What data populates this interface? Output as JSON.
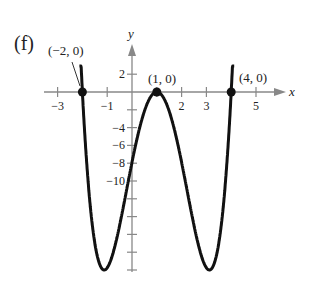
{
  "panel_label": "(f)",
  "chart_data": {
    "type": "line",
    "title": "",
    "xlabel": "x",
    "ylabel": "y",
    "xlim": [
      -3.5,
      6.5
    ],
    "ylim": [
      -20,
      3
    ],
    "grid": false,
    "x_ticks": [
      -3,
      -2,
      -1,
      1,
      2,
      3,
      4,
      5
    ],
    "x_tick_labels": [
      "-3",
      "-1",
      "2",
      "3",
      "5"
    ],
    "x_tick_label_values": [
      -3,
      -1,
      2,
      3,
      5
    ],
    "y_ticks": [
      2,
      -2,
      -4,
      -6,
      -8,
      -10,
      -12,
      -14,
      -16,
      -18,
      -20
    ],
    "y_tick_labels": [
      "2",
      "-4",
      "-6",
      "-8",
      "-10"
    ],
    "y_tick_label_values": [
      2,
      -4,
      -6,
      -8,
      -10
    ],
    "series": [
      {
        "name": "f(x)",
        "description": "quartic with zeros at -2, 1 (double), 4; local minima near y=-20"
      }
    ],
    "points": [
      {
        "label": "(−2, 0)",
        "x": -2,
        "y": 0
      },
      {
        "label": "(1, 0)",
        "x": 1,
        "y": 0
      },
      {
        "label": "(4, 0)",
        "x": 4,
        "y": 0
      }
    ]
  }
}
